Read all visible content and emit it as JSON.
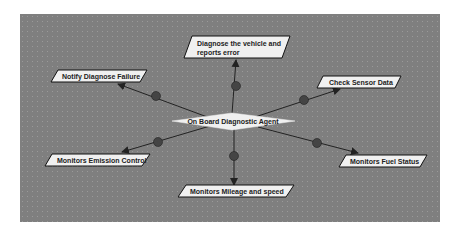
{
  "diagram": {
    "center": {
      "label": "On Board Diagnostic Agent"
    },
    "nodes": [
      {
        "id": "diagnose",
        "line1": "Diagnose the vehicle and",
        "line2": "reports error"
      },
      {
        "id": "notify",
        "label": "Notify Diagnose Failure"
      },
      {
        "id": "sensor",
        "label": "Check Sensor Data"
      },
      {
        "id": "emission",
        "label": "Monitors Emission Control"
      },
      {
        "id": "fuel",
        "label": "Monitors Fuel Status"
      },
      {
        "id": "mileage",
        "label": "Monitors Mileage and speed"
      }
    ],
    "colors": {
      "canvas": "#7f7f7f",
      "node_fill": "#f0f0f0",
      "node_border": "#111111",
      "edge": "#222222",
      "junction": "#444444"
    }
  }
}
